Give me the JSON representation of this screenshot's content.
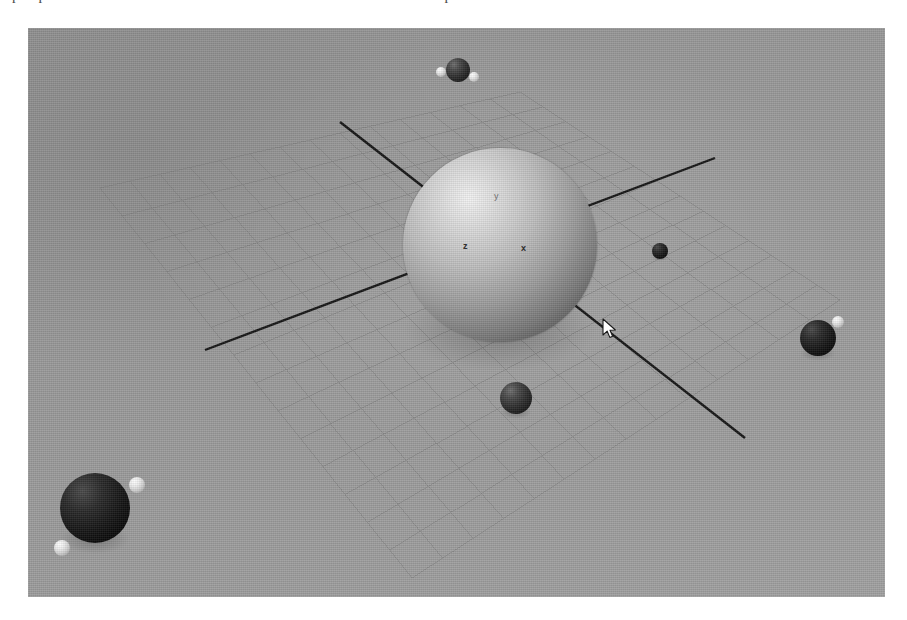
{
  "page": {
    "width": 907,
    "height": 620,
    "background": "#ffffff",
    "top_text_fragment": "perspective view of the simulation cell with water molecules in the periodic box"
  },
  "viewport": {
    "label": "3d-viewport",
    "x": 28,
    "y": 28,
    "width": 857,
    "height": 569,
    "background_color": "#9c9c9c"
  },
  "axis_gizmo": {
    "label_x": "x",
    "label_y": "y",
    "label_z": "z",
    "origin": {
      "x": 497,
      "y": 242
    },
    "color": "#242424"
  },
  "ground_grid": {
    "name": "perspective-ground-grid",
    "color": "#7e7e7e",
    "divisions": 14,
    "corners": [
      {
        "name": "left",
        "x": 100,
        "y": 188
      },
      {
        "name": "top",
        "x": 520,
        "y": 92
      },
      {
        "name": "right",
        "x": 840,
        "y": 300
      },
      {
        "name": "front",
        "x": 412,
        "y": 578
      }
    ]
  },
  "axis_lines": [
    {
      "name": "axis-line-a",
      "x1": 340,
      "y1": 122,
      "x2": 745,
      "y2": 438,
      "color": "#161616",
      "width": 2.4
    },
    {
      "name": "axis-line-b",
      "x1": 205,
      "y1": 350,
      "x2": 715,
      "y2": 158,
      "color": "#161616",
      "width": 2.4
    }
  ],
  "atoms": [
    {
      "name": "central-sphere",
      "kind": "big",
      "cx": 500,
      "cy": 245,
      "r": 97,
      "shadow": true
    },
    {
      "name": "molecule-top-center",
      "kind": "dark",
      "cx": 458,
      "cy": 70,
      "r": 12,
      "shadow": false
    },
    {
      "name": "molecule-top-h-left",
      "kind": "light",
      "cx": 441,
      "cy": 72,
      "r": 5,
      "shadow": false
    },
    {
      "name": "molecule-top-h-right",
      "kind": "light",
      "cx": 474,
      "cy": 77,
      "r": 5,
      "shadow": false
    },
    {
      "name": "atom-right-mid",
      "kind": "darker",
      "cx": 660,
      "cy": 251,
      "r": 8,
      "shadow": true
    },
    {
      "name": "atom-below-sphere",
      "kind": "dark",
      "cx": 516,
      "cy": 398,
      "r": 16,
      "shadow": true
    },
    {
      "name": "molecule-right-center",
      "kind": "darker",
      "cx": 818,
      "cy": 338,
      "r": 18,
      "shadow": true
    },
    {
      "name": "molecule-right-h",
      "kind": "light",
      "cx": 838,
      "cy": 322,
      "r": 6,
      "shadow": false
    },
    {
      "name": "molecule-lowleft-center",
      "kind": "darker",
      "cx": 95,
      "cy": 508,
      "r": 35,
      "shadow": true
    },
    {
      "name": "molecule-lowleft-h-top",
      "kind": "light",
      "cx": 137,
      "cy": 485,
      "r": 8,
      "shadow": false
    },
    {
      "name": "molecule-lowleft-h-bot",
      "kind": "light",
      "cx": 62,
      "cy": 548,
      "r": 8,
      "shadow": false
    }
  ],
  "cursor": {
    "name": "mouse-cursor-arrow",
    "x": 602,
    "y": 318,
    "color": "#ffffff",
    "outline": "#1a1a1a"
  },
  "colors": {
    "viewport_background": "#9c9c9c",
    "grid_line": "#7e7e7e",
    "axis_line": "#161616",
    "gizmo_text": "#242424",
    "page_background": "#ffffff"
  }
}
